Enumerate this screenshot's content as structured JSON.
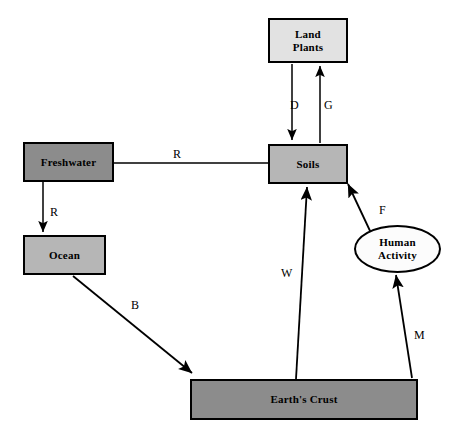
{
  "diagram": {
    "background_color": "#ffffff",
    "stroke_color": "#000000",
    "nodes": [
      {
        "id": "land-plants",
        "label": "Land\nPlants",
        "line1": "Land",
        "line2": "Plants",
        "shape": "rect",
        "x": 268,
        "y": 18,
        "w": 80,
        "h": 45,
        "fill": "#e2e2e2"
      },
      {
        "id": "freshwater",
        "label": "Freshwater",
        "line1": "Freshwater",
        "line2": "",
        "shape": "rect",
        "x": 23,
        "y": 142,
        "w": 91,
        "h": 40,
        "fill": "#8c8c8c"
      },
      {
        "id": "soils",
        "label": "Soils",
        "line1": "Soils",
        "line2": "",
        "shape": "rect",
        "x": 268,
        "y": 144,
        "w": 80,
        "h": 40,
        "fill": "#b6b6b6"
      },
      {
        "id": "ocean",
        "label": "Ocean",
        "line1": "Ocean",
        "line2": "",
        "shape": "rect",
        "x": 23,
        "y": 235,
        "w": 83,
        "h": 40,
        "fill": "#b6b6b6"
      },
      {
        "id": "human-activity",
        "label": "Human\nActivity",
        "line1": "Human",
        "line2": "Activity",
        "shape": "ellipse",
        "x": 354,
        "y": 225,
        "w": 87,
        "h": 48,
        "fill": "#fcfcfc"
      },
      {
        "id": "earths-crust",
        "label": "Earth's Crust",
        "line1": "Earth's Crust",
        "line2": "",
        "shape": "rect",
        "x": 190,
        "y": 379,
        "w": 228,
        "h": 41,
        "fill": "#8c8c8c"
      }
    ],
    "edges": [
      {
        "id": "d-edge",
        "label": "D",
        "from": "land-plants",
        "to": "soils",
        "arrow": "to",
        "label_x": 290,
        "label_y": 98
      },
      {
        "id": "g-edge",
        "label": "G",
        "from": "soils",
        "to": "land-plants",
        "arrow": "to",
        "label_x": 324,
        "label_y": 98
      },
      {
        "id": "r-freshwater-soils",
        "label": "R",
        "from": "freshwater",
        "to": "soils",
        "arrow": "none",
        "label_x": 173,
        "label_y": 152
      },
      {
        "id": "r-freshwater-ocean",
        "label": "R",
        "from": "freshwater",
        "to": "ocean",
        "arrow": "to",
        "label_x": 50,
        "label_y": 209
      },
      {
        "id": "b-edge",
        "label": "B",
        "from": "ocean",
        "to": "earths-crust",
        "arrow": "to",
        "label_x": 131,
        "label_y": 302
      },
      {
        "id": "w-edge",
        "label": "W",
        "from": "earths-crust",
        "to": "soils",
        "arrow": "to",
        "label_x": 282,
        "label_y": 266
      },
      {
        "id": "f-edge",
        "label": "F",
        "from": "human-activity",
        "to": "soils",
        "arrow": "to",
        "label_x": 379,
        "label_y": 207
      },
      {
        "id": "m-edge",
        "label": "M",
        "from": "earths-crust",
        "to": "human-activity",
        "arrow": "to",
        "label_x": 415,
        "label_y": 331
      }
    ]
  }
}
